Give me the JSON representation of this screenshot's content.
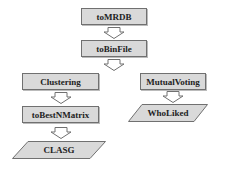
{
  "diagram": {
    "nodes": [
      {
        "id": "toMRDB",
        "label": "toMRDB",
        "shape": "rectangle"
      },
      {
        "id": "toBinFile",
        "label": "toBinFile",
        "shape": "rectangle"
      },
      {
        "id": "Clustering",
        "label": "Clustering",
        "shape": "rectangle"
      },
      {
        "id": "MutualVoting",
        "label": "MutualVoting",
        "shape": "rectangle"
      },
      {
        "id": "toBestNMatrix",
        "label": "toBestNMatrix",
        "shape": "rectangle"
      },
      {
        "id": "CLASG",
        "label": "CLASG",
        "shape": "parallelogram"
      },
      {
        "id": "WhoLiked",
        "label": "WhoLiked",
        "shape": "parallelogram"
      }
    ],
    "edges": [
      {
        "from": "toMRDB",
        "to": "toBinFile"
      },
      {
        "from": "toBinFile",
        "to": "Clustering"
      },
      {
        "from": "toBinFile",
        "to": "MutualVoting"
      },
      {
        "from": "Clustering",
        "to": "toBestNMatrix"
      },
      {
        "from": "toBestNMatrix",
        "to": "CLASG"
      },
      {
        "from": "MutualVoting",
        "to": "WhoLiked"
      }
    ],
    "colors": {
      "fill": "#d9d9d9",
      "stroke": "#707070",
      "arrow_fill": "#ffffff"
    }
  }
}
